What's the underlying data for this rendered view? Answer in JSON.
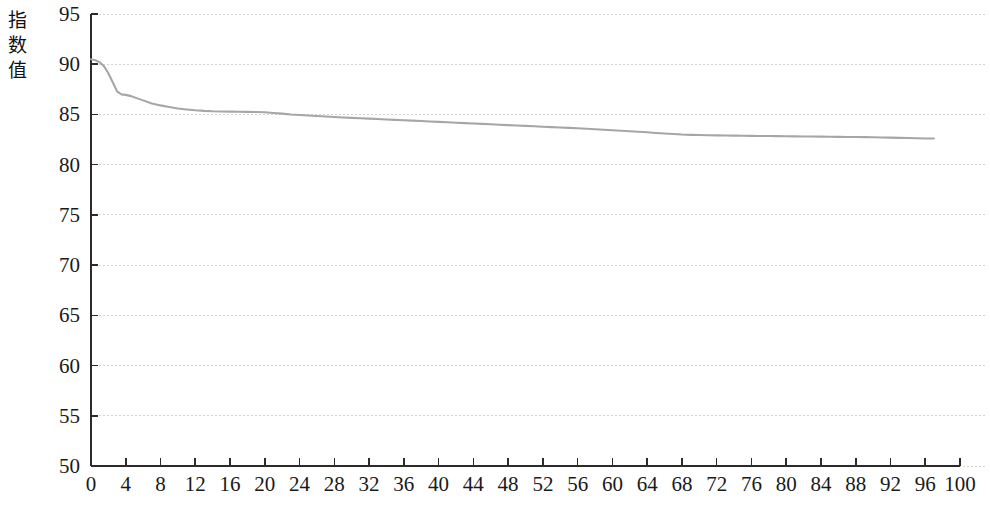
{
  "chart_data": {
    "type": "line",
    "title": "",
    "subtitle": "",
    "xlabel": "",
    "ylabel": "指数值",
    "xlim": [
      0,
      100
    ],
    "ylim": [
      50,
      95
    ],
    "grid": true,
    "legend": false,
    "legend_position": "none",
    "line_color": "#a6a6a6",
    "axis_color": "#2b2b2b",
    "grid_color": "#d9d3cb",
    "x_ticks": [
      0,
      4,
      8,
      12,
      16,
      20,
      24,
      28,
      32,
      36,
      40,
      44,
      48,
      52,
      56,
      60,
      64,
      68,
      72,
      76,
      80,
      84,
      88,
      92,
      96,
      100
    ],
    "y_ticks": [
      50,
      55,
      60,
      65,
      70,
      75,
      80,
      85,
      90,
      95
    ],
    "series": [
      {
        "name": "指数值",
        "x": [
          0,
          0.5,
          1,
          1.5,
          2,
          2.5,
          3,
          3.5,
          4,
          4.5,
          5,
          5.5,
          6,
          7,
          8,
          9,
          10,
          11,
          12,
          13,
          14,
          15,
          16,
          17,
          18,
          19,
          20,
          21,
          22,
          23,
          24,
          25,
          26,
          27,
          28,
          29,
          30,
          31,
          32,
          33,
          34,
          35,
          36,
          37,
          38,
          39,
          40,
          41,
          42,
          43,
          44,
          45,
          46,
          47,
          48,
          49,
          50,
          51,
          52,
          53,
          54,
          55,
          56,
          57,
          58,
          59,
          60,
          61,
          62,
          63,
          64,
          65,
          66,
          67,
          68,
          69,
          70,
          71,
          72,
          73,
          74,
          75,
          76,
          77,
          78,
          79,
          80,
          81,
          82,
          83,
          84,
          85,
          86,
          87,
          88,
          89,
          90,
          91,
          92,
          93,
          94,
          95,
          96,
          97
        ],
        "values": [
          90.5,
          90.4,
          90.2,
          89.8,
          89.1,
          88.2,
          87.3,
          87.0,
          86.95,
          86.85,
          86.7,
          86.55,
          86.4,
          86.1,
          85.9,
          85.75,
          85.6,
          85.5,
          85.42,
          85.36,
          85.32,
          85.3,
          85.28,
          85.27,
          85.26,
          85.25,
          85.22,
          85.15,
          85.08,
          85.0,
          84.95,
          84.9,
          84.85,
          84.8,
          84.75,
          84.7,
          84.66,
          84.62,
          84.58,
          84.54,
          84.5,
          84.46,
          84.42,
          84.38,
          84.34,
          84.3,
          84.26,
          84.22,
          84.18,
          84.14,
          84.1,
          84.06,
          84.02,
          83.98,
          83.94,
          83.9,
          83.86,
          83.82,
          83.78,
          83.74,
          83.7,
          83.66,
          83.62,
          83.58,
          83.53,
          83.48,
          83.43,
          83.38,
          83.33,
          83.28,
          83.22,
          83.16,
          83.1,
          83.05,
          83.0,
          82.97,
          82.95,
          82.93,
          82.92,
          82.9,
          82.89,
          82.88,
          82.87,
          82.86,
          82.85,
          82.84,
          82.83,
          82.82,
          82.81,
          82.8,
          82.79,
          82.78,
          82.77,
          82.76,
          82.75,
          82.74,
          82.73,
          82.71,
          82.69,
          82.67,
          82.65,
          82.63,
          82.61,
          82.6
        ]
      }
    ]
  }
}
